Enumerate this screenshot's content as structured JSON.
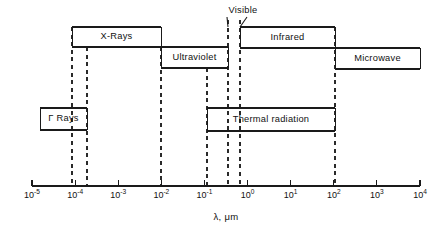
{
  "figure": {
    "type": "spectrum-band-diagram",
    "axis_title": "λ, μm",
    "axis": {
      "scale": "log10",
      "x_start_px": 32,
      "x_end_px": 420,
      "baseline_y_px": 186,
      "decade_width_px": 43.1,
      "exponent_min": -5,
      "exponent_max": 4,
      "tick_labels": [
        {
          "mantissa": "10",
          "exponent": "-5"
        },
        {
          "mantissa": "10",
          "exponent": "-4"
        },
        {
          "mantissa": "10",
          "exponent": "-3"
        },
        {
          "mantissa": "10",
          "exponent": "-2"
        },
        {
          "mantissa": "10",
          "exponent": "-1"
        },
        {
          "mantissa": "10",
          "exponent": "0"
        },
        {
          "mantissa": "10",
          "exponent": "1"
        },
        {
          "mantissa": "10",
          "exponent": "2"
        },
        {
          "mantissa": "10",
          "exponent": "3"
        },
        {
          "mantissa": "10",
          "exponent": "4"
        }
      ]
    },
    "bands": [
      {
        "id": "x-rays",
        "label": "X-Rays",
        "row": "upper",
        "x_left_px": 72,
        "x_right_px": 161,
        "y_top_px": 27,
        "y_bottom_px": 47
      },
      {
        "id": "ultraviolet",
        "label": "Ultraviolet",
        "row": "upper-lower",
        "x_left_px": 161,
        "x_right_px": 228,
        "y_top_px": 47,
        "y_bottom_px": 68
      },
      {
        "id": "infrared",
        "label": "Infrared",
        "row": "upper",
        "x_left_px": 240,
        "x_right_px": 335,
        "y_top_px": 27,
        "y_bottom_px": 48
      },
      {
        "id": "microwave",
        "label": "Microwave",
        "row": "upper-lower",
        "x_left_px": 335,
        "x_right_px": 420,
        "y_top_px": 48,
        "y_bottom_px": 69
      },
      {
        "id": "gamma-rays",
        "label": "Γ Rays",
        "row": "lower",
        "x_left_px": 40,
        "x_right_px": 87,
        "y_top_px": 108,
        "y_bottom_px": 130
      },
      {
        "id": "thermal-radiation",
        "label": "Thermal radiation",
        "row": "lower",
        "x_left_px": 207,
        "x_right_px": 335,
        "y_top_px": 108,
        "y_bottom_px": 131
      }
    ],
    "callouts": [
      {
        "id": "visible",
        "label": "Visible",
        "label_x_px": 243,
        "label_y_px": 6,
        "x_left_px": 228,
        "x_right_px": 240
      }
    ],
    "boundary_lines": [
      {
        "id": "gamma-xray-left",
        "x_px": 72,
        "y_top_px": 27,
        "y_bottom_px": 186
      },
      {
        "id": "gamma-right",
        "x_px": 87,
        "y_top_px": 47,
        "y_bottom_px": 186
      },
      {
        "id": "xray-uv",
        "x_px": 161,
        "y_top_px": 47,
        "y_bottom_px": 186
      },
      {
        "id": "thermal-left",
        "x_px": 207,
        "y_top_px": 68,
        "y_bottom_px": 186
      },
      {
        "id": "visible-left",
        "x_px": 228,
        "y_top_px": 20,
        "y_bottom_px": 186
      },
      {
        "id": "visible-right",
        "x_px": 240,
        "y_top_px": 20,
        "y_bottom_px": 186
      },
      {
        "id": "infrared-microwave",
        "x_px": 335,
        "y_top_px": 27,
        "y_bottom_px": 186
      }
    ]
  },
  "chart_data": {
    "type": "bar",
    "xlabel": "λ, μm",
    "ylabel": "",
    "xscale": "log",
    "xlim": [
      1e-05,
      10000.0
    ],
    "grid": false,
    "legend": "none",
    "tick_labels": [
      "10-5",
      "10-4",
      "10-3",
      "10-2",
      "10-1",
      "100",
      "101",
      "102",
      "103",
      "104"
    ],
    "categories": [
      "X-Rays",
      "Ultraviolet",
      "Visible",
      "Infrared",
      "Microwave",
      "Γ Rays",
      "Thermal radiation"
    ],
    "bands_wavelength_um": [
      {
        "name": "X-Rays",
        "lambda_min": 0.0002,
        "lambda_max": 0.01
      },
      {
        "name": "Ultraviolet",
        "lambda_min": 0.01,
        "lambda_max": 0.38
      },
      {
        "name": "Visible",
        "lambda_min": 0.38,
        "lambda_max": 0.76
      },
      {
        "name": "Infrared",
        "lambda_min": 0.76,
        "lambda_max": 100
      },
      {
        "name": "Microwave",
        "lambda_min": 100,
        "lambda_max": 10000
      },
      {
        "name": "Γ Rays",
        "lambda_min": 2e-05,
        "lambda_max": 0.0005
      },
      {
        "name": "Thermal radiation",
        "lambda_min": 0.1,
        "lambda_max": 100
      }
    ],
    "annotations": [
      "Visible"
    ]
  }
}
